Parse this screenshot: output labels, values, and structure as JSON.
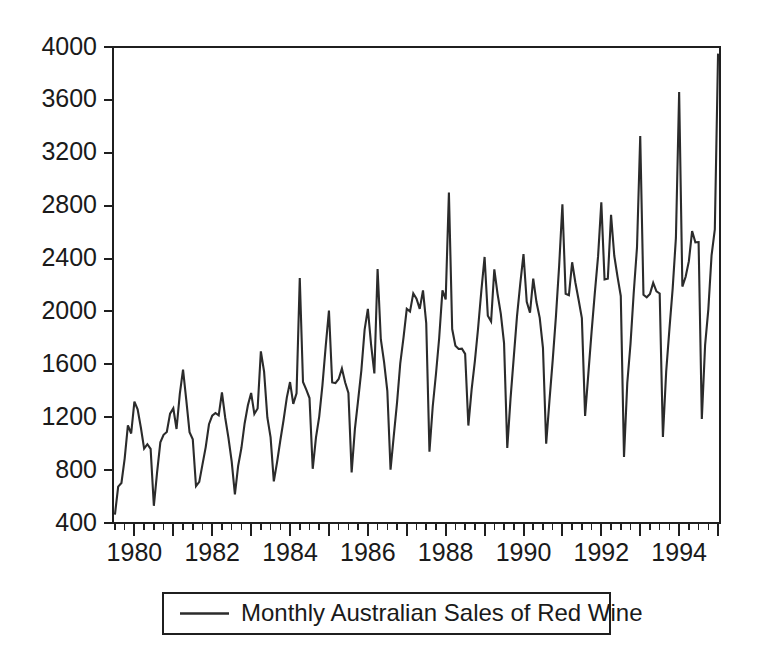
{
  "chart_data": {
    "type": "line",
    "title": "",
    "xlabel": "",
    "ylabel": "",
    "xlim": [
      1979.45,
      1995.05
    ],
    "ylim": [
      400,
      4000
    ],
    "grid": false,
    "legend_position": "below-center",
    "yticks": [
      400,
      800,
      1200,
      1600,
      2000,
      2400,
      2800,
      3200,
      3600,
      4000
    ],
    "ytick_labels": [
      "400",
      "800",
      "1200",
      "1600",
      "2000",
      "2400",
      "2800",
      "3200",
      "3600",
      "4000"
    ],
    "xticks_major": [
      1980,
      1981,
      1982,
      1983,
      1984,
      1985,
      1986,
      1987,
      1988,
      1989,
      1990,
      1991,
      1992,
      1993,
      1994,
      1995
    ],
    "xtick_labels_shown": [
      "1980",
      "1982",
      "1984",
      "1986",
      "1988",
      "1990",
      "1992",
      "1994"
    ],
    "xtick_labeled_values": [
      1980,
      1982,
      1984,
      1986,
      1988,
      1990,
      1992,
      1994
    ],
    "xtick_minor_step": 0.25,
    "series": [
      {
        "name": "Monthly Australian Sales of Red Wine",
        "color": "#2b2b2b",
        "x": [
          1979.5,
          1979.583,
          1979.667,
          1979.75,
          1979.833,
          1979.917,
          1980.0,
          1980.083,
          1980.167,
          1980.25,
          1980.333,
          1980.417,
          1980.5,
          1980.583,
          1980.667,
          1980.75,
          1980.833,
          1980.917,
          1981.0,
          1981.083,
          1981.167,
          1981.25,
          1981.333,
          1981.417,
          1981.5,
          1981.583,
          1981.667,
          1981.75,
          1981.833,
          1981.917,
          1982.0,
          1982.083,
          1982.167,
          1982.25,
          1982.333,
          1982.417,
          1982.5,
          1982.583,
          1982.667,
          1982.75,
          1982.833,
          1982.917,
          1983.0,
          1983.083,
          1983.167,
          1983.25,
          1983.333,
          1983.417,
          1983.5,
          1983.583,
          1983.667,
          1983.75,
          1983.833,
          1983.917,
          1984.0,
          1984.083,
          1984.167,
          1984.25,
          1984.333,
          1984.417,
          1984.5,
          1984.583,
          1984.667,
          1984.75,
          1984.833,
          1984.917,
          1985.0,
          1985.083,
          1985.167,
          1985.25,
          1985.333,
          1985.417,
          1985.5,
          1985.583,
          1985.667,
          1985.75,
          1985.833,
          1985.917,
          1986.0,
          1986.083,
          1986.167,
          1986.25,
          1986.333,
          1986.417,
          1986.5,
          1986.583,
          1986.667,
          1986.75,
          1986.833,
          1986.917,
          1987.0,
          1987.083,
          1987.167,
          1987.25,
          1987.333,
          1987.417,
          1987.5,
          1987.583,
          1987.667,
          1987.75,
          1987.833,
          1987.917,
          1988.0,
          1988.083,
          1988.167,
          1988.25,
          1988.333,
          1988.417,
          1988.5,
          1988.583,
          1988.667,
          1988.75,
          1988.833,
          1988.917,
          1989.0,
          1989.083,
          1989.167,
          1989.25,
          1989.333,
          1989.417,
          1989.5,
          1989.583,
          1989.667,
          1989.75,
          1989.833,
          1989.917,
          1990.0,
          1990.083,
          1990.167,
          1990.25,
          1990.333,
          1990.417,
          1990.5,
          1990.583,
          1990.667,
          1990.75,
          1990.833,
          1990.917,
          1991.0,
          1991.083,
          1991.167,
          1991.25,
          1991.333,
          1991.417,
          1991.5,
          1991.583,
          1991.667,
          1991.75,
          1991.833,
          1991.917,
          1992.0,
          1992.083,
          1992.167,
          1992.25,
          1992.333,
          1992.417,
          1992.5,
          1992.583,
          1992.667,
          1992.75,
          1992.833,
          1992.917,
          1993.0,
          1993.083,
          1993.167,
          1993.25,
          1993.333,
          1993.417,
          1993.5,
          1993.583,
          1993.667,
          1993.75,
          1993.833,
          1993.917,
          1994.0,
          1994.083,
          1994.167,
          1994.25,
          1994.333,
          1994.417,
          1994.5,
          1994.583,
          1994.667,
          1994.75,
          1994.833,
          1994.917,
          1995.0
        ],
        "values": [
          464,
          675,
          703,
          887,
          1139,
          1077,
          1318,
          1260,
          1120,
          963,
          996,
          960,
          530,
          783,
          1010,
          1067,
          1088,
          1227,
          1267,
          1111,
          1376,
          1560,
          1331,
          1087,
          1033,
          679,
          711,
          843,
          974,
          1147,
          1212,
          1232,
          1214,
          1387,
          1198,
          1044,
          866,
          616,
          833,
          967,
          1153,
          1290,
          1384,
          1225,
          1266,
          1698,
          1545,
          1198,
          1048,
          715,
          860,
          1024,
          1177,
          1348,
          1466,
          1301,
          1381,
          2253,
          1467,
          1409,
          1345,
          810,
          1048,
          1205,
          1442,
          1738,
          2006,
          1463,
          1458,
          1489,
          1568,
          1463,
          1383,
          783,
          1112,
          1329,
          1554,
          1863,
          2020,
          1749,
          1531,
          2321,
          1790,
          1617,
          1400,
          803,
          1062,
          1310,
          1608,
          1803,
          2020,
          1999,
          2137,
          2096,
          2019,
          2159,
          1911,
          940,
          1281,
          1527,
          1799,
          2159,
          2091,
          2900,
          1867,
          1741,
          1716,
          1719,
          1679,
          1137,
          1411,
          1625,
          1873,
          2158,
          2412,
          1968,
          1924,
          2319,
          2133,
          1982,
          1760,
          968,
          1343,
          1655,
          1964,
          2211,
          2434,
          2073,
          1990,
          2248,
          2071,
          1952,
          1725,
          1000,
          1326,
          1630,
          1961,
          2349,
          2810,
          2134,
          2123,
          2372,
          2219,
          2087,
          1949,
          1210,
          1532,
          1847,
          2141,
          2418,
          2826,
          2242,
          2248,
          2730,
          2421,
          2261,
          2117,
          900,
          1459,
          1755,
          2143,
          2484,
          3327,
          2126,
          2107,
          2132,
          2216,
          2152,
          2136,
          1051,
          1546,
          1866,
          2171,
          2556,
          3660,
          2188,
          2262,
          2380,
          2608,
          2523,
          2525,
          1187,
          1745,
          2016,
          2424,
          2621,
          3950
        ]
      }
    ]
  },
  "legend": {
    "entries": [
      {
        "label": "Monthly Australian Sales of Red Wine",
        "color": "#2b2b2b",
        "marker": "line"
      }
    ]
  },
  "colors": {
    "background": "#ffffff",
    "axis": "#1f1f1f",
    "series": "#2b2b2b",
    "text": "#1a1a1a"
  }
}
